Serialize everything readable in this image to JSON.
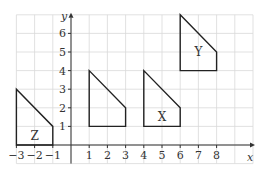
{
  "diagram": {
    "type": "coordinate-grid-transformations",
    "x_axis": {
      "label": "x",
      "min": -3,
      "max": 10,
      "tick_labels": [
        "−3",
        "−2",
        "−1",
        "1",
        "2",
        "3",
        "4",
        "5",
        "6",
        "7",
        "8"
      ],
      "tick_values": [
        -3,
        -2,
        -1,
        1,
        2,
        3,
        4,
        5,
        6,
        7,
        8
      ]
    },
    "y_axis": {
      "label": "y",
      "min": -1,
      "max": 7,
      "tick_labels": [
        "1",
        "2",
        "3",
        "4",
        "5",
        "6"
      ],
      "tick_values": [
        1,
        2,
        3,
        4,
        5,
        6
      ]
    },
    "shapes": [
      {
        "name": "Z",
        "label": "Z",
        "vertices": [
          [
            -3,
            0
          ],
          [
            -3,
            3
          ],
          [
            -1,
            1
          ],
          [
            -1,
            0
          ]
        ],
        "label_pos": [
          -2,
          0.5
        ]
      },
      {
        "name": "unlabeled",
        "label": "",
        "vertices": [
          [
            1,
            1
          ],
          [
            1,
            4
          ],
          [
            3,
            2
          ],
          [
            3,
            1
          ]
        ],
        "label_pos": null
      },
      {
        "name": "X",
        "label": "X",
        "vertices": [
          [
            4,
            1
          ],
          [
            4,
            4
          ],
          [
            6,
            2
          ],
          [
            6,
            1
          ]
        ],
        "label_pos": [
          5,
          1.5
        ]
      },
      {
        "name": "Y",
        "label": "Y",
        "vertices": [
          [
            6,
            4
          ],
          [
            6,
            7
          ],
          [
            8,
            5
          ],
          [
            8,
            4
          ]
        ],
        "label_pos": [
          7,
          5
        ]
      }
    ],
    "colors": {
      "grid": "#d9d9d9",
      "axis": "#333333",
      "shape_stroke": "#222222"
    }
  }
}
